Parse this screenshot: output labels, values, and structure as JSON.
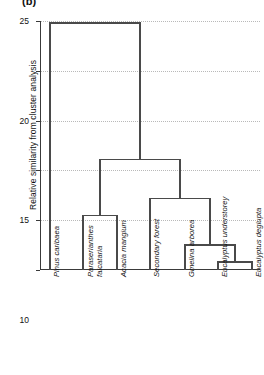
{
  "figure": {
    "panel_label": "(b)",
    "ylabel": "Relative similarity from cluster analysis"
  },
  "chart_data": {
    "type": "dendrogram",
    "title": "(b)",
    "xlabel": "",
    "ylabel": "Relative similarity from cluster analysis",
    "ylim": [
      0,
      25
    ],
    "yticks": [
      0,
      5,
      10,
      15,
      20,
      25
    ],
    "ytick_labels": [
      "0",
      "5",
      "10",
      "15",
      "20",
      "25"
    ],
    "grid": true,
    "grid_style": "dotted horizontal gridlines",
    "orientation": "vertical, leaves at bottom",
    "leaf_order": [
      "Pinus caribaea",
      "Paraserianthes falcataria",
      "Acacia mangium",
      "Secondary forest",
      "Gmelina arborea",
      "Eucalyptus understorey",
      "Eucalyptus deglupta"
    ],
    "leaves": [
      {
        "label": "Pinus caribaea",
        "lines": [
          "Pinus caribaea"
        ],
        "x": 50,
        "italic": true
      },
      {
        "label": "Paraserianthes falcataria",
        "lines": [
          "Paraserianthes",
          "falcataria"
        ],
        "x": 83,
        "italic": true
      },
      {
        "label": "Acacia mangium",
        "lines": [
          "Acacia mangium"
        ],
        "x": 117,
        "italic": true
      },
      {
        "label": "Secondary forest",
        "lines": [
          "Secondary forest"
        ],
        "x": 150,
        "italic": true
      },
      {
        "label": "Gmelina arborea",
        "lines": [
          "Gmelina arborea"
        ],
        "x": 185,
        "italic": true
      },
      {
        "label": "Eucalyptus understorey",
        "lines": [
          "Eucalyptus understorey"
        ],
        "x": 218,
        "italic": true
      },
      {
        "label": "Eucalyptus deglupta",
        "lines": [
          "Eucalyptus deglupta"
        ],
        "x": 252,
        "italic": true
      }
    ],
    "merges": [
      {
        "name": "eucalyptus-pair",
        "height": 0.8,
        "members": [
          "Eucalyptus understorey",
          "Eucalyptus deglupta"
        ]
      },
      {
        "name": "gmelina-eucalyptus",
        "height": 2.5,
        "members": [
          "Gmelina arborea",
          "eucalyptus-pair"
        ]
      },
      {
        "name": "paraserianthes-acacia",
        "height": 5.5,
        "members": [
          "Paraserianthes falcataria",
          "Acacia mangium"
        ]
      },
      {
        "name": "secondary-plantation",
        "height": 7.2,
        "members": [
          "Secondary forest",
          "gmelina-eucalyptus"
        ]
      },
      {
        "name": "broadleaf-cluster",
        "height": 11.1,
        "members": [
          "paraserianthes-acacia",
          "secondary-plantation"
        ]
      },
      {
        "name": "root",
        "height": 24.8,
        "members": [
          "Pinus caribaea",
          "broadleaf-cluster"
        ]
      }
    ],
    "line_color": "#4a4a4a",
    "axis_color": "#3a3a3a",
    "grid_color": "#b9b9b9",
    "background": "#ffffff"
  }
}
